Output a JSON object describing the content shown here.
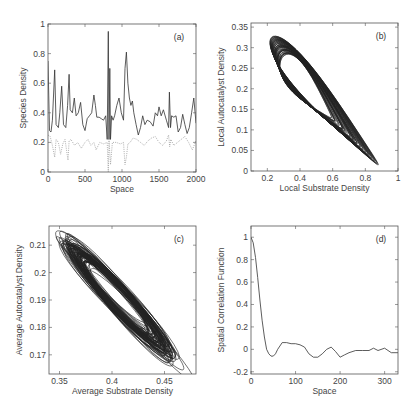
{
  "chart_data": [
    {
      "id": "a",
      "type": "line",
      "panel_label": "(a)",
      "xlabel": "Space",
      "ylabel": "Species Density",
      "xlim": [
        0,
        2000
      ],
      "ylim": [
        0,
        1
      ],
      "xticks": [
        0,
        500,
        1000,
        1500,
        2000
      ],
      "yticks": [
        0,
        0.2,
        0.4,
        0.6,
        0.8,
        1
      ],
      "ytick_labels": [
        "0",
        "0.2",
        "0.4",
        "0.6",
        "0.8",
        "1"
      ],
      "series": [
        {
          "name": "substrate (solid)",
          "style": "solid",
          "x": [
            0,
            20,
            40,
            60,
            90,
            110,
            140,
            160,
            185,
            210,
            240,
            265,
            285,
            300,
            330,
            355,
            380,
            410,
            440,
            470,
            500,
            530,
            560,
            590,
            620,
            640,
            660,
            690,
            720,
            750,
            780,
            800,
            815,
            825,
            835,
            845,
            860,
            880,
            900,
            930,
            960,
            990,
            1020,
            1040,
            1060,
            1080,
            1100,
            1120,
            1140,
            1160,
            1190,
            1220,
            1250,
            1280,
            1310,
            1340,
            1380,
            1420,
            1450,
            1480,
            1500,
            1530,
            1560,
            1600,
            1630,
            1640,
            1655,
            1670,
            1700,
            1730,
            1760,
            1790,
            1820,
            1850,
            1880,
            1910,
            1940,
            1970,
            2000
          ],
          "y": [
            0.75,
            0.28,
            0.27,
            0.35,
            0.69,
            0.32,
            0.3,
            0.4,
            0.58,
            0.32,
            0.3,
            0.45,
            0.66,
            0.42,
            0.4,
            0.5,
            0.38,
            0.4,
            0.47,
            0.32,
            0.28,
            0.36,
            0.38,
            0.4,
            0.52,
            0.45,
            0.37,
            0.37,
            0.36,
            0.35,
            0.38,
            0.22,
            0.95,
            0.22,
            0.7,
            0.22,
            0.38,
            0.35,
            0.38,
            0.45,
            0.5,
            0.4,
            0.35,
            0.7,
            0.81,
            0.6,
            0.5,
            0.45,
            0.48,
            0.4,
            0.32,
            0.25,
            0.3,
            0.38,
            0.32,
            0.35,
            0.34,
            0.31,
            0.4,
            0.38,
            0.44,
            0.38,
            0.42,
            0.35,
            0.3,
            0.54,
            0.3,
            0.38,
            0.37,
            0.38,
            0.27,
            0.3,
            0.39,
            0.32,
            0.26,
            0.3,
            0.4,
            0.5,
            0.33
          ]
        },
        {
          "name": "autocatalyst (dotted)",
          "style": "dotted",
          "x": [
            0,
            30,
            60,
            90,
            110,
            140,
            170,
            200,
            230,
            270,
            285,
            310,
            360,
            400,
            450,
            500,
            540,
            580,
            620,
            650,
            700,
            750,
            800,
            815,
            825,
            845,
            870,
            920,
            980,
            1020,
            1040,
            1060,
            1080,
            1110,
            1150,
            1200,
            1250,
            1300,
            1350,
            1400,
            1450,
            1500,
            1550,
            1600,
            1630,
            1645,
            1660,
            1700,
            1750,
            1800,
            1850,
            1900,
            1950,
            2000
          ],
          "y": [
            0.25,
            0.24,
            0.18,
            0.1,
            0.22,
            0.2,
            0.12,
            0.19,
            0.22,
            0.08,
            0.21,
            0.22,
            0.18,
            0.2,
            0.16,
            0.2,
            0.22,
            0.18,
            0.2,
            0.15,
            0.2,
            0.19,
            0.2,
            0.0,
            0.22,
            0.05,
            0.2,
            0.2,
            0.19,
            0.2,
            0.05,
            0.1,
            0.19,
            0.2,
            0.23,
            0.22,
            0.2,
            0.18,
            0.21,
            0.23,
            0.24,
            0.2,
            0.18,
            0.21,
            0.25,
            0.17,
            0.22,
            0.18,
            0.2,
            0.22,
            0.24,
            0.2,
            0.15,
            0.21
          ]
        }
      ]
    },
    {
      "id": "b",
      "type": "line",
      "panel_label": "(b)",
      "xlabel": "Local Substrate Density",
      "ylabel": "Local Autocatalyst Density",
      "xlim": [
        0.1,
        1.0
      ],
      "ylim": [
        0,
        0.36
      ],
      "xticks": [
        0.2,
        0.4,
        0.6,
        0.8,
        1
      ],
      "xtick_labels": [
        "0.2",
        "0.4",
        "0.6",
        "0.8",
        "1"
      ],
      "yticks": [
        0,
        0.05,
        0.1,
        0.15,
        0.2,
        0.25,
        0.3,
        0.35
      ],
      "ytick_labels": [
        "0",
        "0.05",
        "0.1",
        "0.15",
        "0.2",
        "0.25",
        "0.3",
        "0.35"
      ],
      "description": "Phase-space trajectory: dense looping orbit spanning substrate 0.22-0.88, autocatalyst 0.015-0.32, elongated diagonally from upper-left to lower-right",
      "orbit": {
        "outer_loop": {
          "x_min": 0.22,
          "x_max": 0.88,
          "y_min": 0.015,
          "y_max": 0.322
        },
        "dense_core_center": [
          0.35,
          0.22
        ]
      }
    },
    {
      "id": "c",
      "type": "line",
      "panel_label": "(c)",
      "xlabel": "Average Substrate Density",
      "ylabel": "Average Autocatalyst Density",
      "xlim": [
        0.34,
        0.48
      ],
      "ylim": [
        0.163,
        0.217
      ],
      "xticks": [
        0.35,
        0.4,
        0.45
      ],
      "xtick_labels": [
        "0.35",
        "0.4",
        "0.45"
      ],
      "yticks": [
        0.17,
        0.18,
        0.19,
        0.2,
        0.21
      ],
      "ytick_labels": [
        "0.17",
        "0.18",
        "0.19",
        "0.2",
        "0.21"
      ],
      "description": "Phase-space trajectory of spatial averages: tangled elliptical orbits elongated along a negative diagonal from (0.36, 0.212) to (0.465, 0.169)",
      "orbit": {
        "x_min": 0.36,
        "x_max": 0.465,
        "y_min": 0.168,
        "y_max": 0.212,
        "center": [
          0.405,
          0.191
        ]
      }
    },
    {
      "id": "d",
      "type": "line",
      "panel_label": "(d)",
      "xlabel": "Space",
      "ylabel": "Spatial Correlation Function",
      "xlim": [
        0,
        330
      ],
      "ylim": [
        -0.22,
        1.1
      ],
      "xticks": [
        0,
        100,
        200,
        300
      ],
      "yticks": [
        -0.2,
        0,
        0.2,
        0.4,
        0.6,
        0.8,
        1
      ],
      "ytick_labels": [
        "-0.2",
        "0",
        "0.2",
        "0.4",
        "0.6",
        "0.8",
        "1"
      ],
      "series": [
        {
          "name": "correlation",
          "x": [
            0,
            5,
            10,
            15,
            20,
            25,
            30,
            35,
            40,
            45,
            50,
            55,
            60,
            70,
            80,
            90,
            100,
            110,
            120,
            130,
            140,
            150,
            160,
            170,
            180,
            190,
            200,
            210,
            220,
            235,
            250,
            265,
            275,
            285,
            300,
            315,
            330
          ],
          "y": [
            1.0,
            0.95,
            0.82,
            0.64,
            0.44,
            0.26,
            0.11,
            0.0,
            -0.04,
            -0.06,
            -0.06,
            -0.04,
            0.0,
            0.06,
            0.06,
            0.05,
            0.05,
            0.04,
            0.02,
            -0.04,
            -0.07,
            -0.07,
            -0.04,
            0.0,
            0.02,
            -0.02,
            -0.07,
            -0.05,
            -0.03,
            -0.01,
            -0.01,
            -0.01,
            0.01,
            -0.01,
            0.01,
            -0.03,
            -0.03
          ]
        }
      ]
    }
  ]
}
